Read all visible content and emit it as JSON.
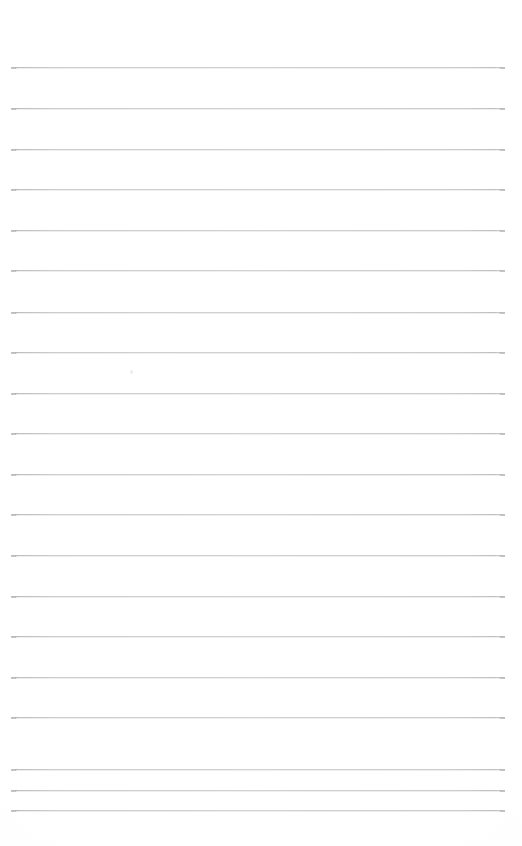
{
  "document": {
    "type": "ruled-paper-scan",
    "title": "Blank Ruled Paper",
    "description": "A blank scanned sheet of wide-ruled lined notebook paper with no handwriting or printed text.",
    "page_width_px": 522,
    "page_height_px": 846,
    "background_color": "#ffffff",
    "has_text_content": false,
    "text_content": "",
    "margin_rule_present": false,
    "punch_holes_present": false,
    "header_present": false,
    "footer_present": false
  },
  "ruling": {
    "line_color": "#cccccc",
    "line_color_dark_tip": "#b2b2b2",
    "line_thickness_px": 1,
    "line_count": 20,
    "line_start_x_px": 11,
    "line_end_x_px": 505,
    "line_length_px": 494,
    "first_line_y_px": 67,
    "last_line_y_px": 810,
    "line_spacing_px": 40.7,
    "top_margin_px": 67,
    "bottom_margin_px": 36,
    "left_margin_px": 11,
    "right_margin_px": 17,
    "line_y_positions": [
      67,
      108,
      149,
      189,
      230,
      270,
      312,
      352,
      393,
      433,
      474,
      514,
      555,
      596,
      636,
      677,
      717,
      769,
      790,
      810
    ]
  },
  "artifacts": {
    "scan_speck": {
      "x_px": 130,
      "y_px": 370,
      "color": "#eeeeee"
    }
  }
}
